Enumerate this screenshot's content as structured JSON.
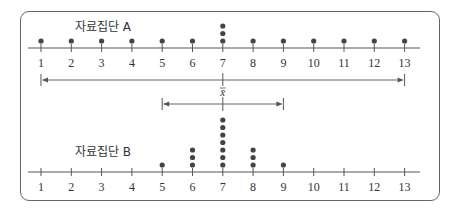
{
  "chart_data": [
    {
      "type": "scatter",
      "subtype": "dot_plot",
      "title": "자료집단 A",
      "x_ticks": [
        1,
        2,
        3,
        4,
        5,
        6,
        7,
        8,
        9,
        10,
        11,
        12,
        13
      ],
      "xlim": [
        1,
        13
      ],
      "values": [
        1,
        2,
        3,
        4,
        5,
        6,
        7,
        7,
        7,
        8,
        9,
        10,
        11,
        12,
        13
      ],
      "counts": {
        "1": 1,
        "2": 1,
        "3": 1,
        "4": 1,
        "5": 1,
        "6": 1,
        "7": 3,
        "8": 1,
        "9": 1,
        "10": 1,
        "11": 1,
        "12": 1,
        "13": 1
      },
      "range_arrow": {
        "from": 1,
        "to": 13
      }
    },
    {
      "type": "scatter",
      "subtype": "dot_plot",
      "title": "자료집단 B",
      "x_ticks": [
        1,
        2,
        3,
        4,
        5,
        6,
        7,
        8,
        9,
        10,
        11,
        12,
        13
      ],
      "xlim": [
        1,
        13
      ],
      "values": [
        5,
        6,
        6,
        6,
        7,
        7,
        7,
        7,
        7,
        7,
        7,
        8,
        8,
        8,
        9
      ],
      "counts": {
        "5": 1,
        "6": 3,
        "7": 7,
        "8": 3,
        "9": 1
      },
      "range_arrow": {
        "from": 5,
        "to": 9
      }
    }
  ],
  "labels": {
    "set_a": "자료집단 A",
    "set_b": "자료집단 B",
    "mean": "x̄",
    "ticks": [
      "1",
      "2",
      "3",
      "4",
      "5",
      "6",
      "7",
      "8",
      "9",
      "10",
      "11",
      "12",
      "13"
    ]
  },
  "mean_value": 7,
  "colors": {
    "dot": "#444444",
    "line": "#555555",
    "frame": "#666666"
  }
}
